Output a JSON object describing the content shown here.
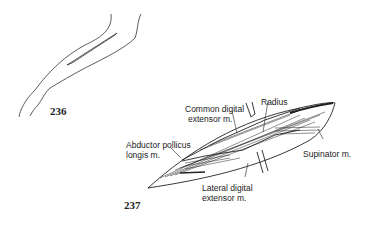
{
  "figures": [
    {
      "number": "236"
    },
    {
      "number": "237",
      "labels": {
        "common_digital_extensor": [
          "Common digital",
          "extensor m."
        ],
        "radius": "Radius",
        "abductor_pollicus": [
          "Abductor pollicus",
          "longis m."
        ],
        "supinator": "Supinator m.",
        "lateral_digital_extensor": [
          "Lateral digital",
          "extensor m."
        ]
      }
    }
  ]
}
